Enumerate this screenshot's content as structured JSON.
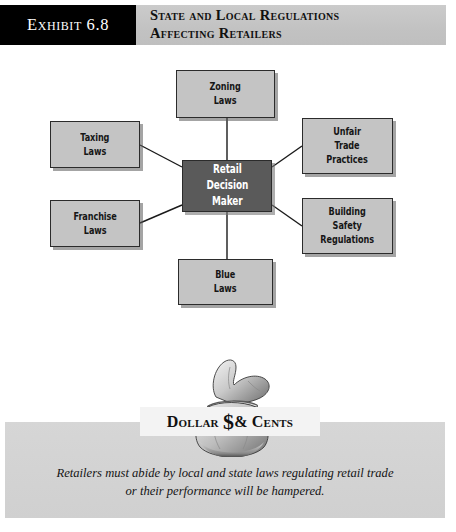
{
  "header": {
    "exhibit_tab": "Exhibit 6.8",
    "title_line1": "State and Local Regulations",
    "title_line2": "Affecting Retailers",
    "tab_bg": "#000000",
    "tab_fg": "#ffffff",
    "bar_bg": "#c6c6c6"
  },
  "diagram": {
    "type": "hub-and-spoke",
    "center": {
      "label": "Retail\nDecision\nMaker",
      "bg": "#5a5a5a",
      "fg": "#ffffff"
    },
    "node_bg": "#c4c4c4",
    "node_fg": "#161616",
    "nodes": [
      {
        "id": "zoning-laws",
        "label": "Zoning\nLaws",
        "position": "top"
      },
      {
        "id": "taxing-laws",
        "label": "Taxing\nLaws",
        "position": "top-left"
      },
      {
        "id": "franchise-laws",
        "label": "Franchise\nLaws",
        "position": "bottom-left"
      },
      {
        "id": "unfair-trade-practices",
        "label": "Unfair\nTrade\nPractices",
        "position": "top-right"
      },
      {
        "id": "building-safety-regulations",
        "label": "Building\nSafety\nRegulations",
        "position": "bottom-right"
      },
      {
        "id": "blue-laws",
        "label": "Blue\nLaws",
        "position": "bottom"
      }
    ]
  },
  "dollars_and_cents": {
    "banner_pre": "Dollar ",
    "banner_dollar": "$",
    "banner_post": "& Cents",
    "caption_line1": "Retailers must abide by local and state laws regulating retail trade",
    "caption_line2": "or their performance will be hampered.",
    "panel_bg": "#d2d2d2",
    "banner_bg": "#f3f3f3"
  }
}
